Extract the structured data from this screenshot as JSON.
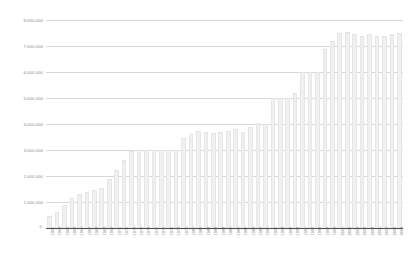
{
  "chart_data": {
    "type": "bar",
    "title": "Chart",
    "xlabel": "",
    "ylabel": "",
    "ylim": [
      0,
      8000000
    ],
    "grid": true,
    "legend": false,
    "bar_color": "#f0f0f0",
    "gridline_color": "#d8d8d8",
    "axis_color": "#4a4a4a",
    "tick_label_color": "#8d8d8d",
    "ytick_labels": [
      "8.000.000",
      "7.000.000",
      "6.000.000",
      "5.000.000",
      "4.000.000",
      "3.000.000",
      "2.000.000",
      "1.000.000"
    ],
    "ytick_values": [
      8000000,
      7000000,
      6000000,
      5000000,
      4000000,
      3000000,
      2000000,
      1000000
    ],
    "zero_label": "0",
    "categories": [
      "1961",
      "1962",
      "1963",
      "1964",
      "1965",
      "1966",
      "1967",
      "1968",
      "1969",
      "1970",
      "1971",
      "1972",
      "1973",
      "1974",
      "1975",
      "1976",
      "1977",
      "1978",
      "1979",
      "1980",
      "1981",
      "1982",
      "1983",
      "1984",
      "1985",
      "1986",
      "1987",
      "1988",
      "1989",
      "1990",
      "1991",
      "1992",
      "1993",
      "1994",
      "1995",
      "1996",
      "1997",
      "1998",
      "1999",
      "2000",
      "2001",
      "2002",
      "2003",
      "2004",
      "2005",
      "2006",
      "2007",
      "2008"
    ],
    "values": [
      480000,
      620000,
      900000,
      1150000,
      1300000,
      1400000,
      1480000,
      1550000,
      1900000,
      2250000,
      2600000,
      2950000,
      3000000,
      3000000,
      3000000,
      3000000,
      3000000,
      3000000,
      3450000,
      3600000,
      3750000,
      3700000,
      3650000,
      3700000,
      3750000,
      3800000,
      3700000,
      3900000,
      4050000,
      4000000,
      5000000,
      5000000,
      5000000,
      5200000,
      6000000,
      6000000,
      6000000,
      6900000,
      7200000,
      7500000,
      7550000,
      7450000,
      7400000,
      7450000,
      7400000,
      7400000,
      7450000,
      7500000
    ]
  }
}
